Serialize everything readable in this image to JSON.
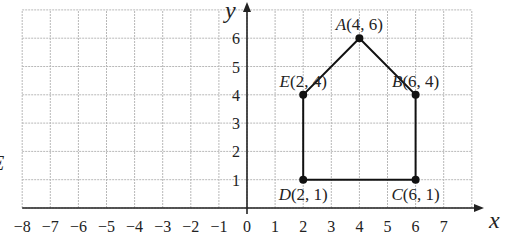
{
  "chart_data": {
    "type": "scatter",
    "title": "",
    "xlabel": "x",
    "ylabel": "y",
    "xlim": [
      -8,
      8
    ],
    "ylim": [
      0,
      7
    ],
    "grid": true,
    "x_ticks": [
      "−8",
      "−7",
      "−6",
      "−5",
      "−4",
      "−3",
      "−2",
      "−1",
      "0",
      "1",
      "2",
      "3",
      "4",
      "5",
      "6",
      "7"
    ],
    "y_ticks": [
      "1",
      "2",
      "3",
      "4",
      "5",
      "6"
    ],
    "points": [
      {
        "name": "A",
        "x": 4,
        "y": 6,
        "label": "(4, 6)"
      },
      {
        "name": "B",
        "x": 6,
        "y": 4,
        "label": "(6, 4)"
      },
      {
        "name": "C",
        "x": 6,
        "y": 1,
        "label": "(6, 1)"
      },
      {
        "name": "D",
        "x": 2,
        "y": 1,
        "label": "(2, 1)"
      },
      {
        "name": "E",
        "x": 2,
        "y": 4,
        "label": "(2, 4)"
      }
    ],
    "polygon": [
      "A",
      "B",
      "C",
      "D",
      "E"
    ],
    "annotations": [
      "E (clipped at left edge)"
    ]
  },
  "colors": {
    "grid": "#b8b8b8",
    "axis": "#222222",
    "shape": "#111111"
  },
  "margin_letter": "E"
}
